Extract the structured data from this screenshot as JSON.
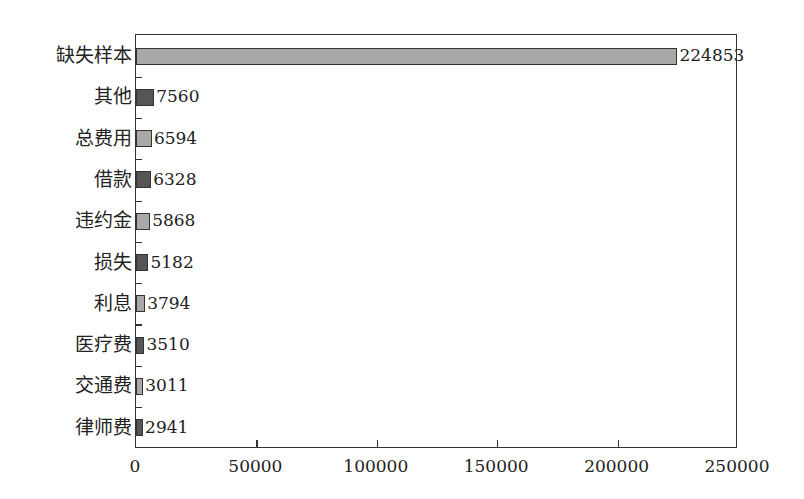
{
  "chart_data": {
    "type": "bar",
    "orientation": "horizontal",
    "title": "",
    "xlabel": "",
    "ylabel": "",
    "categories": [
      "缺失样本",
      "其他",
      "总费用",
      "借款",
      "违约金",
      "损失",
      "利息",
      "医疗费",
      "交通费",
      "律师费"
    ],
    "values": [
      224853,
      7560,
      6594,
      6328,
      5868,
      5182,
      3794,
      3510,
      3011,
      2941
    ],
    "value_labels": [
      "224853",
      "7560",
      "6594",
      "6328",
      "5868",
      "5182",
      "3794",
      "3510",
      "3011",
      "2941"
    ],
    "bar_colors": [
      "#a9a9a9",
      "#555555",
      "#a9a9a9",
      "#555555",
      "#a9a9a9",
      "#555555",
      "#a9a9a9",
      "#555555",
      "#a9a9a9",
      "#555555"
    ],
    "xlim": [
      0,
      250000
    ],
    "xticks": [
      0,
      50000,
      100000,
      150000,
      200000,
      250000
    ],
    "xtick_labels": [
      "0",
      "50000",
      "100000",
      "150000",
      "200000",
      "250000"
    ],
    "grid": false,
    "legend": null
  }
}
